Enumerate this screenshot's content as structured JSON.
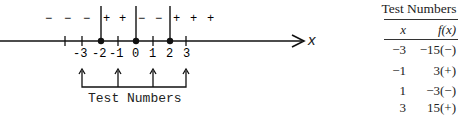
{
  "number_line": {
    "axis_label": "x",
    "tick_labels": [
      "-3",
      "-2",
      "-1",
      "0",
      "1",
      "2",
      "3"
    ],
    "critical_points": [
      "-2",
      "0",
      "2"
    ],
    "sign_marks": [
      "−",
      "−",
      "−",
      "+",
      "+",
      "−",
      "−",
      "+",
      "+",
      "+"
    ],
    "bracket_label": "Test Numbers",
    "test_points": [
      "-3",
      "-1",
      "1",
      "3"
    ]
  },
  "table": {
    "title": "Test Numbers",
    "headers": {
      "x": "x",
      "fx": "f(x)"
    },
    "rows": [
      {
        "x": "−3",
        "fx": "−15(−)"
      },
      {
        "x": "−1",
        "fx": "3(+)"
      },
      {
        "x": "1",
        "fx": "−3(−)"
      },
      {
        "x": "3",
        "fx": "15(+)"
      }
    ]
  }
}
